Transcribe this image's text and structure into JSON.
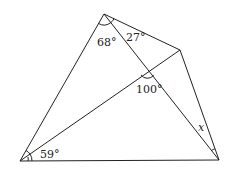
{
  "diagram": {
    "type": "geometry",
    "points": {
      "top": [
        104,
        14
      ],
      "upper_right": [
        180,
        50
      ],
      "bottom_right": [
        219,
        160
      ],
      "bottom_left": [
        20,
        161
      ]
    },
    "segments": [
      [
        "top",
        "upper_right"
      ],
      [
        "upper_right",
        "bottom_right"
      ],
      [
        "bottom_right",
        "bottom_left"
      ],
      [
        "bottom_left",
        "top"
      ],
      [
        "top",
        "bottom_right"
      ],
      [
        "bottom_left",
        "upper_right"
      ]
    ],
    "labels": {
      "angle_top_left": "68°",
      "angle_top_right": "27°",
      "angle_intersection": "100°",
      "angle_bottom_left": "59°",
      "angle_unknown": "x"
    }
  }
}
